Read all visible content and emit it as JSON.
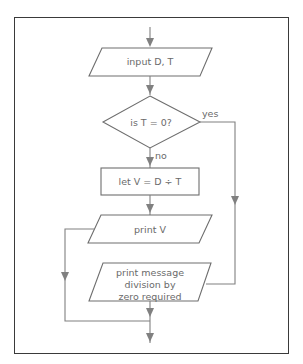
{
  "diagram": {
    "type": "flowchart",
    "nodes": {
      "input": {
        "shape": "parallelogram",
        "label": "input D, T"
      },
      "decision": {
        "shape": "diamond",
        "label": "is T = 0?"
      },
      "process": {
        "shape": "rectangle",
        "label": "let V = D ÷ T"
      },
      "print_v": {
        "shape": "parallelogram",
        "label": "print V"
      },
      "print_msg": {
        "shape": "parallelogram",
        "label_lines": [
          "print message",
          "division by",
          "zero required"
        ]
      }
    },
    "edges": {
      "yes": "yes",
      "no": "no"
    },
    "colors": {
      "frame": "#3a3a3a",
      "lines": "#808080",
      "text": "#6a6a6a"
    }
  }
}
